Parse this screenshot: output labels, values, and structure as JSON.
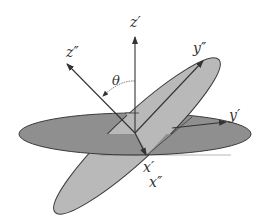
{
  "diagram": {
    "colors": {
      "background": "#ffffff",
      "horizontal_plane": "#8f8f8f",
      "tilted_plane": "#b9b9b9",
      "outline": "#3a3a3a",
      "axis": "#333333"
    },
    "labels": {
      "z_prime": "z′",
      "z_double_prime": "z″",
      "y_prime": "y′",
      "y_double_prime": "y″",
      "x_prime": "x′",
      "x_double_prime": "x″",
      "theta": "θ"
    }
  }
}
